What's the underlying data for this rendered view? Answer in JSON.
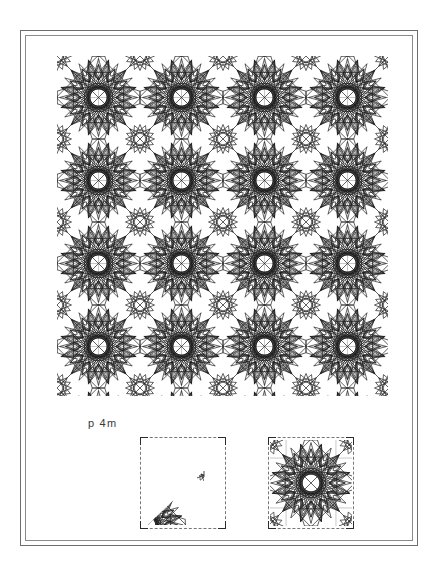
{
  "page": {
    "background_color": "#ffffff",
    "frame": {
      "name": "double-rule-border",
      "outer_color": "#6e6e6e",
      "inner_color": "#8a8a8a"
    }
  },
  "plate": {
    "group_label": "p 4m",
    "caption_color": "#3a3a3a"
  },
  "pattern": {
    "name": "islamic-geometric-tiling",
    "line_color": "#1c1c1c",
    "grid_color": "#9a9a9a",
    "stroke_width": 0.7,
    "grid_stroke_width": 0.55,
    "lattice_period_px": 83,
    "columns": 4,
    "rows": 4,
    "symmetry_group": "p4m",
    "rosette_points": 12,
    "secondary_rosette_points": 8
  },
  "figures": [
    {
      "id": "fundamental-domain",
      "label": "",
      "border_style": "dashed",
      "corner_marks": 4,
      "contents": "fundamental-domain-triangle"
    },
    {
      "id": "unit-cell",
      "label": "",
      "border_style": "dashed",
      "corner_marks": 4,
      "contents": "unit-cell-rosette"
    }
  ],
  "chart_data": {
    "type": "table",
    "rows": [
      [
        "group",
        "p 4m"
      ],
      [
        "lattice",
        "square"
      ],
      [
        "rosette",
        "12-point star"
      ],
      [
        "tiling columns",
        "4"
      ],
      [
        "tiling rows",
        "4"
      ]
    ]
  }
}
